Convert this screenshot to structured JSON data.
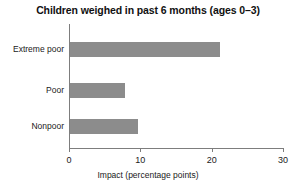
{
  "chart_data": {
    "type": "bar",
    "orientation": "horizontal",
    "title": "Children weighed in past 6 months (ages 0–3)",
    "xlabel": "Impact (percentage points)",
    "ylabel": "",
    "categories": [
      "Extreme poor",
      "Poor",
      "Nonpoor"
    ],
    "values": [
      21.0,
      7.7,
      9.5
    ],
    "xlim": [
      0,
      30
    ],
    "xticks": [
      0,
      10,
      20,
      30
    ],
    "xtick_labels": [
      "0",
      "10",
      "20",
      "30"
    ],
    "grid": false,
    "legend": false,
    "bar_color": "#8c8c8c",
    "axis_color": "#7d7d7d",
    "background_color": "#ffffff",
    "text_color": "#1a1a1a"
  }
}
